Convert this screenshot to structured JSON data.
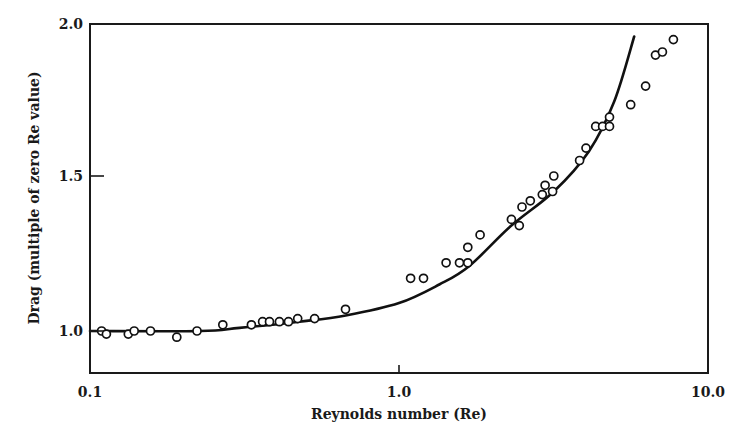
{
  "chart_data": {
    "type": "scatter",
    "title": "",
    "xlabel": "Reynolds number (Re)",
    "ylabel": "Drag (multiple of zero Re value)",
    "xscale": "log",
    "xlim": [
      0.1,
      10.0
    ],
    "ylim": [
      0.865,
      2.0
    ],
    "x_ticks": [
      0.1,
      1.0,
      10.0
    ],
    "x_tick_labels": [
      "0.1",
      "1.0",
      "10.0"
    ],
    "y_ticks": [
      1.0,
      1.5,
      2.0
    ],
    "y_tick_labels": [
      "1.0",
      "1.5",
      "2.0"
    ],
    "grid": false,
    "legend": null,
    "series": [
      {
        "name": "Observed",
        "kind": "scatter",
        "marker": "open-circle",
        "points": [
          [
            0.109,
            1.0
          ],
          [
            0.113,
            0.99
          ],
          [
            0.133,
            0.99
          ],
          [
            0.139,
            1.0
          ],
          [
            0.157,
            1.0
          ],
          [
            0.191,
            0.98
          ],
          [
            0.222,
            1.0
          ],
          [
            0.269,
            1.02
          ],
          [
            0.333,
            1.02
          ],
          [
            0.362,
            1.03
          ],
          [
            0.381,
            1.03
          ],
          [
            0.41,
            1.03
          ],
          [
            0.439,
            1.03
          ],
          [
            0.47,
            1.04
          ],
          [
            0.533,
            1.04
          ],
          [
            0.671,
            1.07
          ],
          [
            1.09,
            1.17
          ],
          [
            1.2,
            1.17
          ],
          [
            1.42,
            1.22
          ],
          [
            1.57,
            1.22
          ],
          [
            1.67,
            1.22
          ],
          [
            1.67,
            1.27
          ],
          [
            1.83,
            1.31
          ],
          [
            2.31,
            1.36
          ],
          [
            2.45,
            1.34
          ],
          [
            2.5,
            1.4
          ],
          [
            2.66,
            1.42
          ],
          [
            2.91,
            1.44
          ],
          [
            2.97,
            1.47
          ],
          [
            3.14,
            1.45
          ],
          [
            3.17,
            1.5
          ],
          [
            3.84,
            1.55
          ],
          [
            4.03,
            1.59
          ],
          [
            4.33,
            1.66
          ],
          [
            4.56,
            1.66
          ],
          [
            4.8,
            1.66
          ],
          [
            4.8,
            1.69
          ],
          [
            5.62,
            1.73
          ],
          [
            6.28,
            1.79
          ],
          [
            6.76,
            1.89
          ],
          [
            7.12,
            1.9
          ],
          [
            7.73,
            1.94
          ]
        ]
      },
      {
        "name": "Theory",
        "kind": "line",
        "points": [
          [
            0.1,
            1.0
          ],
          [
            0.227,
            1.0
          ],
          [
            0.305,
            1.01
          ],
          [
            0.476,
            1.03
          ],
          [
            0.672,
            1.05
          ],
          [
            1.0,
            1.09
          ],
          [
            1.35,
            1.15
          ],
          [
            1.69,
            1.21
          ],
          [
            2.31,
            1.34
          ],
          [
            3.17,
            1.45
          ],
          [
            4.12,
            1.58
          ],
          [
            4.97,
            1.74
          ],
          [
            5.77,
            1.95
          ]
        ]
      }
    ]
  }
}
